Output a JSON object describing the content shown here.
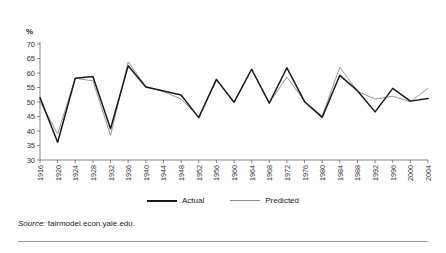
{
  "axis": {
    "y_unit_label": "%",
    "y_ticks": [
      30,
      35,
      40,
      45,
      50,
      55,
      60,
      65,
      70
    ],
    "x_ticks": [
      1916,
      1920,
      1924,
      1928,
      1932,
      1936,
      1940,
      1944,
      1948,
      1952,
      1956,
      1960,
      1964,
      1968,
      1972,
      1976,
      1980,
      1984,
      1988,
      1992,
      1996,
      2000,
      2004
    ]
  },
  "legend": {
    "position": "bottom-center",
    "entries": [
      {
        "label": "Actual",
        "color": "#1a1a1a"
      },
      {
        "label": "Predicted",
        "color": "#8c8c8c"
      }
    ]
  },
  "source": {
    "prefix": "Source:",
    "text": "fairmodel.econ.yale.edu."
  },
  "colors": {
    "actual": "#1a1a1a",
    "predicted": "#8c8c8c",
    "axis": "#666666",
    "rule": "#9a9a9a"
  },
  "chart_data": {
    "type": "line",
    "title": "",
    "xlabel": "",
    "ylabel": "%",
    "ylim": [
      30,
      70
    ],
    "xlim": [
      1916,
      2004
    ],
    "grid": false,
    "legend_position": "bottom-center",
    "x": [
      1916,
      1920,
      1924,
      1928,
      1932,
      1936,
      1940,
      1944,
      1948,
      1952,
      1956,
      1960,
      1964,
      1968,
      1972,
      1976,
      1980,
      1984,
      1988,
      1992,
      1996,
      2000,
      2004
    ],
    "series": [
      {
        "name": "Actual",
        "color": "#1a1a1a",
        "values": [
          51.5,
          36.1,
          58.2,
          58.8,
          40.8,
          62.5,
          55.2,
          53.8,
          52.4,
          44.6,
          57.8,
          49.9,
          61.3,
          49.6,
          61.8,
          50.1,
          44.7,
          59.2,
          53.9,
          46.6,
          54.7,
          50.3,
          51.2
        ]
      },
      {
        "name": "Predicted",
        "color": "#8c8c8c",
        "values": [
          50.2,
          39.0,
          58.2,
          57.3,
          38.5,
          63.8,
          55.4,
          53.6,
          51.0,
          44.9,
          57.4,
          50.1,
          61.3,
          49.7,
          58.6,
          50.3,
          45.1,
          62.0,
          53.7,
          51.0,
          52.0,
          50.1,
          54.7
        ]
      }
    ]
  }
}
